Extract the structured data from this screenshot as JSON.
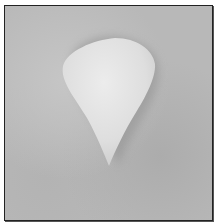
{
  "image": {
    "subject": "white petal-shaped object on gray surface",
    "colors": {
      "background": "#b8b8b8",
      "object": "#e6e6e6",
      "shadow": "#9a9a9a",
      "border": "#222222"
    }
  }
}
